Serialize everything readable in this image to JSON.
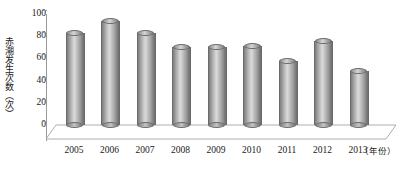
{
  "chart_data": {
    "type": "bar",
    "title": "",
    "subtitle": "",
    "xlabel": "（年份）",
    "ylabel": "赤潮发生次数（次）",
    "categories": [
      "2005",
      "2006",
      "2007",
      "2008",
      "2009",
      "2010",
      "2011",
      "2012",
      "2013"
    ],
    "values": [
      83,
      94,
      83,
      70,
      70,
      71,
      58,
      76,
      49
    ],
    "series": [
      {
        "name": "赤潮发生次数",
        "values": [
          83,
          94,
          83,
          70,
          70,
          71,
          58,
          76,
          49
        ]
      }
    ],
    "ylim": [
      0,
      100
    ],
    "yticks": [
      0,
      20,
      40,
      60,
      80,
      100
    ],
    "ytick_labels": [
      "0",
      "20",
      "40",
      "60",
      "80",
      "100"
    ],
    "grid": false,
    "legend": "none",
    "style": "3d-cylinder",
    "bar_color": "#b0b0b0",
    "axis_color": "#9a9a9a",
    "text_color": "#1a1a1a",
    "background": "#ffffff"
  }
}
